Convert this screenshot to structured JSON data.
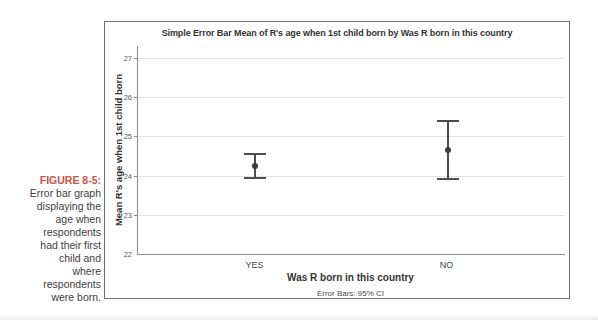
{
  "figure_caption": {
    "label": "FIGURE 8-5:",
    "lines": [
      "Error bar graph",
      "displaying the",
      "age when",
      "respondents",
      "had their first",
      "child and",
      "where",
      "respondents",
      "were born."
    ],
    "label_color": "#c9544a"
  },
  "chart_data": {
    "type": "errorbar",
    "title": "Simple Error Bar Mean of R's age when 1st child born by Was R born in this country",
    "xlabel": "Was R born in this country",
    "ylabel": "Mean R's age when 1st child born",
    "footnote": "Error Bars: 95% CI",
    "categories": [
      "YES",
      "NO"
    ],
    "series": [
      {
        "name": "Mean R's age when 1st child born",
        "means": [
          24.25,
          24.65
        ],
        "ci_low": [
          23.95,
          23.9
        ],
        "ci_high": [
          24.55,
          25.4
        ]
      }
    ],
    "error_bar_meaning": "95% CI",
    "yticks": [
      22,
      23,
      24,
      25,
      26,
      27
    ],
    "ylim": [
      22,
      27.3
    ],
    "grid": true,
    "legend_position": "none",
    "colors": {
      "error_bar": "#4d4d4d",
      "marker": "#3d3d3d",
      "gridline": "#e2e2e2",
      "axis": "#8a8a8a",
      "frame_border": "#6f6f6f"
    }
  }
}
